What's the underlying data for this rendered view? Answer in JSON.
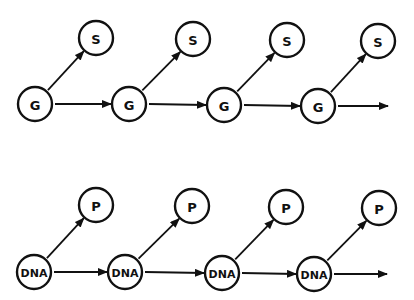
{
  "diagram": {
    "type": "chain-diagram",
    "rows": [
      {
        "name": "gene-row",
        "main_label": "G",
        "branch_label": "S",
        "main_nodes": [
          {
            "label": "G",
            "x": 35,
            "y": 104
          },
          {
            "label": "G",
            "x": 129,
            "y": 104
          },
          {
            "label": "G",
            "x": 224,
            "y": 105
          },
          {
            "label": "G",
            "x": 318,
            "y": 106
          }
        ],
        "branch_nodes": [
          {
            "label": "S",
            "x": 96,
            "y": 38
          },
          {
            "label": "S",
            "x": 193,
            "y": 39
          },
          {
            "label": "S",
            "x": 287,
            "y": 40
          },
          {
            "label": "S",
            "x": 378,
            "y": 41
          }
        ],
        "final_arrow_end_x": 388
      },
      {
        "name": "dna-row",
        "main_label": "DNA",
        "branch_label": "P",
        "main_nodes": [
          {
            "label": "DNA",
            "x": 34,
            "y": 272
          },
          {
            "label": "DNA",
            "x": 125,
            "y": 272
          },
          {
            "label": "DNA",
            "x": 222,
            "y": 273
          },
          {
            "label": "DNA",
            "x": 314,
            "y": 274
          }
        ],
        "branch_nodes": [
          {
            "label": "P",
            "x": 96,
            "y": 205
          },
          {
            "label": "P",
            "x": 192,
            "y": 206
          },
          {
            "label": "P",
            "x": 286,
            "y": 207
          },
          {
            "label": "P",
            "x": 379,
            "y": 208
          }
        ],
        "final_arrow_end_x": 387
      }
    ],
    "node_radius": 17,
    "colors": {
      "stroke": "#111111",
      "fill": "#ffffff",
      "background": "#ffffff"
    }
  }
}
